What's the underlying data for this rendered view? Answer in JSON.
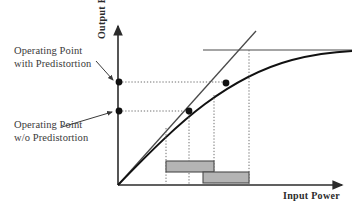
{
  "figure": {
    "kind": "amplifier-transfer-characteristic-diagram",
    "axes": {
      "y_label": "Output Power",
      "x_label": "Input  Power",
      "origin": {
        "x": 118,
        "y": 185
      },
      "y_axis_top": {
        "x": 118,
        "y": 22
      },
      "x_axis_right": {
        "x": 347,
        "y": 185
      }
    },
    "annotations": [
      {
        "id": "with-predistortion",
        "line1": "Operating Point",
        "line2": "with Predistortion",
        "text_x": 14,
        "text_y": 44,
        "leader_from": {
          "x": 97,
          "y": 62
        },
        "leader_to": {
          "x": 115,
          "y": 81
        }
      },
      {
        "id": "without-predistortion",
        "line1": "Operating Point",
        "line2": "w/o Predistortion",
        "text_x": 14,
        "text_y": 118,
        "leader_from": {
          "x": 62,
          "y": 126
        },
        "leader_to": {
          "x": 115,
          "y": 112
        }
      }
    ],
    "curves": {
      "saturating_characteristic": {
        "name": "nonlinear-amplifier-curve",
        "color": "#111111",
        "path": "M 118 185 C 150 152, 178 124, 205 104 C 232 84, 262 68, 292 60 C 315 54, 332 52, 352 51"
      },
      "ideal_linear": {
        "name": "ideal-linear-line",
        "color": "#4a4a4a",
        "from": {
          "x": 118,
          "y": 185
        },
        "to": {
          "x": 256,
          "y": 31
        }
      },
      "saturation_level": {
        "name": "saturation-horizontal-line",
        "color": "#4a4a4a",
        "from": {
          "x": 203,
          "y": 50
        },
        "to": {
          "x": 352,
          "y": 50
        }
      }
    },
    "operating_points": [
      {
        "id": "axis-dot-with-pd",
        "x": 119,
        "y": 82
      },
      {
        "id": "curve-dot-with-pd",
        "x": 226,
        "y": 83
      },
      {
        "id": "axis-dot-wo-pd",
        "x": 119,
        "y": 111
      },
      {
        "id": "curve-dot-wo-pd",
        "x": 189,
        "y": 111
      }
    ],
    "guides": {
      "color": "#6f6f6f",
      "horizontal": [
        {
          "id": "guide-h-with-pd",
          "x1": 119,
          "x2": 226,
          "y": 82
        },
        {
          "id": "guide-h-wo-pd",
          "x1": 119,
          "x2": 189,
          "y": 111
        }
      ],
      "vertical": [
        {
          "id": "guide-v-wo-pd-low",
          "x": 166,
          "y1": 130,
          "y2": 185
        },
        {
          "id": "guide-v-wo-pd-op",
          "x": 189,
          "y1": 111,
          "y2": 185
        },
        {
          "id": "guide-v-with-pd-low",
          "x": 214,
          "y1": 96,
          "y2": 185
        },
        {
          "id": "guide-v-with-pd-op",
          "x": 249,
          "y1": 50,
          "y2": 185
        }
      ]
    },
    "range_bars": [
      {
        "id": "input-range-without-predistortion",
        "x": 166,
        "y": 161,
        "width": 48,
        "height": 11,
        "fill": "#b4b4b4",
        "stroke": "#4a4a4a"
      },
      {
        "id": "input-range-with-predistortion",
        "x": 203,
        "y": 172,
        "width": 46,
        "height": 11,
        "fill": "#b4b4b4",
        "stroke": "#4a4a4a"
      }
    ]
  }
}
